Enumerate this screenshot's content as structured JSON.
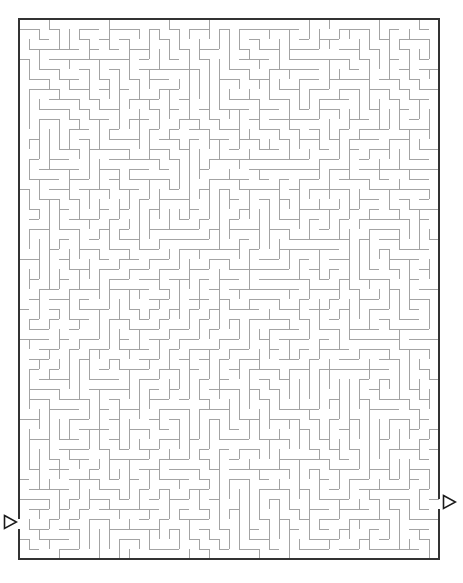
{
  "puzzle": {
    "type": "maze",
    "title": "",
    "background_color": "#ffffff",
    "canvas": {
      "width": 463,
      "height": 583
    }
  },
  "maze": {
    "origin_x": 19,
    "origin_y": 19,
    "cell_size": 10,
    "cols": 42,
    "rows": 54,
    "wall_color": "#a3a3a3",
    "wall_width": 1,
    "border_color": "#333333",
    "border_width": 2,
    "seed": 20240517,
    "braid_factor": 0.04
  },
  "entrance": {
    "label": "entrance-arrow",
    "side": "left",
    "row": 50,
    "glyph": "right-triangle-outline",
    "color": "#1a1a1a",
    "x": 3,
    "y": 514,
    "width": 15,
    "height": 16
  },
  "exit": {
    "label": "exit-arrow",
    "side": "right",
    "row": 48,
    "glyph": "right-triangle-outline",
    "color": "#1a1a1a",
    "x": 442,
    "y": 494,
    "width": 15,
    "height": 16
  }
}
